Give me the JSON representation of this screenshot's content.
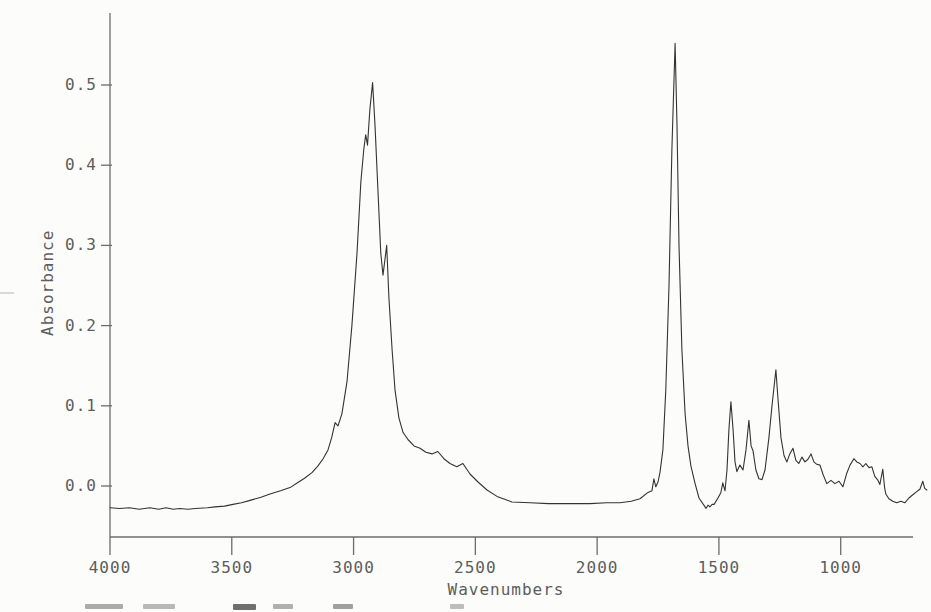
{
  "chart_data": {
    "type": "line",
    "title": "",
    "xlabel": "Wavenumbers",
    "ylabel": "Absorbance",
    "grid": false,
    "legend": false,
    "x_axis": {
      "direction": "decreasing",
      "tick_values": [
        4000,
        3500,
        3000,
        2500,
        2000,
        1500,
        1000
      ],
      "tick_labels": [
        "4000",
        "3500",
        "3000",
        "2500",
        "2000",
        "1500",
        "1000"
      ],
      "drawn_range": [
        4000,
        703
      ]
    },
    "y_axis": {
      "tick_values": [
        0.0,
        0.1,
        0.2,
        0.3,
        0.4,
        0.5
      ],
      "tick_labels": [
        "0.0",
        "0.1",
        "0.2",
        "0.3",
        "0.4",
        "0.5"
      ],
      "drawn_range": [
        -0.063,
        0.59
      ]
    },
    "series": [
      {
        "name": "IR absorbance spectrum",
        "points": [
          [
            4000,
            -0.027
          ],
          [
            3960,
            -0.028
          ],
          [
            3920,
            -0.027
          ],
          [
            3880,
            -0.029
          ],
          [
            3836,
            -0.027
          ],
          [
            3800,
            -0.029
          ],
          [
            3770,
            -0.027
          ],
          [
            3740,
            -0.029
          ],
          [
            3713,
            -0.028
          ],
          [
            3680,
            -0.029
          ],
          [
            3650,
            -0.028
          ],
          [
            3600,
            -0.027
          ],
          [
            3569,
            -0.026
          ],
          [
            3530,
            -0.025
          ],
          [
            3495,
            -0.023
          ],
          [
            3460,
            -0.021
          ],
          [
            3425,
            -0.018
          ],
          [
            3380,
            -0.014
          ],
          [
            3343,
            -0.01
          ],
          [
            3300,
            -0.006
          ],
          [
            3261,
            -0.002
          ],
          [
            3230,
            0.004
          ],
          [
            3200,
            0.01
          ],
          [
            3170,
            0.017
          ],
          [
            3146,
            0.025
          ],
          [
            3125,
            0.034
          ],
          [
            3105,
            0.045
          ],
          [
            3090,
            0.06
          ],
          [
            3076,
            0.079
          ],
          [
            3064,
            0.075
          ],
          [
            3048,
            0.09
          ],
          [
            3027,
            0.13
          ],
          [
            3007,
            0.2
          ],
          [
            2986,
            0.29
          ],
          [
            2970,
            0.38
          ],
          [
            2958,
            0.42
          ],
          [
            2950,
            0.438
          ],
          [
            2943,
            0.425
          ],
          [
            2933,
            0.47
          ],
          [
            2922,
            0.503
          ],
          [
            2912,
            0.45
          ],
          [
            2900,
            0.37
          ],
          [
            2888,
            0.29
          ],
          [
            2879,
            0.263
          ],
          [
            2864,
            0.3
          ],
          [
            2855,
            0.235
          ],
          [
            2842,
            0.17
          ],
          [
            2830,
            0.12
          ],
          [
            2814,
            0.085
          ],
          [
            2797,
            0.067
          ],
          [
            2777,
            0.058
          ],
          [
            2752,
            0.05
          ],
          [
            2727,
            0.047
          ],
          [
            2703,
            0.042
          ],
          [
            2678,
            0.04
          ],
          [
            2654,
            0.043
          ],
          [
            2629,
            0.034
          ],
          [
            2604,
            0.028
          ],
          [
            2576,
            0.024
          ],
          [
            2551,
            0.028
          ],
          [
            2522,
            0.015
          ],
          [
            2489,
            0.005
          ],
          [
            2452,
            -0.005
          ],
          [
            2411,
            -0.013
          ],
          [
            2366,
            -0.018
          ],
          [
            2350,
            -0.02
          ],
          [
            2276,
            -0.021
          ],
          [
            2200,
            -0.022
          ],
          [
            2153,
            -0.022
          ],
          [
            2090,
            -0.022
          ],
          [
            2030,
            -0.022
          ],
          [
            1960,
            -0.021
          ],
          [
            1906,
            -0.021
          ],
          [
            1860,
            -0.019
          ],
          [
            1824,
            -0.016
          ],
          [
            1791,
            -0.008
          ],
          [
            1775,
            -0.006
          ],
          [
            1767,
            0.009
          ],
          [
            1759,
            -0.001
          ],
          [
            1750,
            0.005
          ],
          [
            1742,
            0.017
          ],
          [
            1730,
            0.045
          ],
          [
            1718,
            0.12
          ],
          [
            1705,
            0.25
          ],
          [
            1693,
            0.42
          ],
          [
            1680,
            0.552
          ],
          [
            1672,
            0.45
          ],
          [
            1664,
            0.3
          ],
          [
            1652,
            0.17
          ],
          [
            1639,
            0.09
          ],
          [
            1627,
            0.05
          ],
          [
            1615,
            0.025
          ],
          [
            1598,
            0.003
          ],
          [
            1582,
            -0.015
          ],
          [
            1566,
            -0.022
          ],
          [
            1559,
            -0.025
          ],
          [
            1553,
            -0.028
          ],
          [
            1545,
            -0.024
          ],
          [
            1537,
            -0.026
          ],
          [
            1528,
            -0.023
          ],
          [
            1520,
            -0.023
          ],
          [
            1504,
            -0.015
          ],
          [
            1492,
            -0.008
          ],
          [
            1484,
            0.004
          ],
          [
            1475,
            -0.006
          ],
          [
            1467,
            0.02
          ],
          [
            1459,
            0.07
          ],
          [
            1451,
            0.105
          ],
          [
            1442,
            0.07
          ],
          [
            1434,
            0.03
          ],
          [
            1426,
            0.018
          ],
          [
            1414,
            0.026
          ],
          [
            1401,
            0.02
          ],
          [
            1389,
            0.045
          ],
          [
            1377,
            0.082
          ],
          [
            1368,
            0.05
          ],
          [
            1360,
            0.044
          ],
          [
            1348,
            0.02
          ],
          [
            1336,
            0.009
          ],
          [
            1323,
            0.008
          ],
          [
            1311,
            0.02
          ],
          [
            1295,
            0.06
          ],
          [
            1282,
            0.1
          ],
          [
            1266,
            0.145
          ],
          [
            1258,
            0.11
          ],
          [
            1245,
            0.06
          ],
          [
            1233,
            0.038
          ],
          [
            1221,
            0.03
          ],
          [
            1209,
            0.04
          ],
          [
            1196,
            0.047
          ],
          [
            1184,
            0.032
          ],
          [
            1172,
            0.028
          ],
          [
            1159,
            0.036
          ],
          [
            1147,
            0.03
          ],
          [
            1135,
            0.033
          ],
          [
            1122,
            0.04
          ],
          [
            1110,
            0.03
          ],
          [
            1098,
            0.027
          ],
          [
            1085,
            0.026
          ],
          [
            1073,
            0.015
          ],
          [
            1057,
            0.003
          ],
          [
            1040,
            0.007
          ],
          [
            1024,
            0.003
          ],
          [
            1007,
            0.006
          ],
          [
            991,
            -0.001
          ],
          [
            975,
            0.016
          ],
          [
            962,
            0.026
          ],
          [
            946,
            0.034
          ],
          [
            934,
            0.03
          ],
          [
            921,
            0.028
          ],
          [
            909,
            0.024
          ],
          [
            897,
            0.028
          ],
          [
            884,
            0.023
          ],
          [
            872,
            0.024
          ],
          [
            860,
            0.012
          ],
          [
            847,
            0.007
          ],
          [
            839,
            0.002
          ],
          [
            827,
            0.021
          ],
          [
            820,
            -0.002
          ],
          [
            815,
            -0.01
          ],
          [
            802,
            -0.016
          ],
          [
            786,
            -0.019
          ],
          [
            770,
            -0.021
          ],
          [
            753,
            -0.019
          ],
          [
            737,
            -0.021
          ],
          [
            720,
            -0.015
          ],
          [
            704,
            -0.011
          ],
          [
            688,
            -0.007
          ],
          [
            675,
            -0.004
          ],
          [
            663,
            0.006
          ],
          [
            655,
            -0.003
          ],
          [
            646,
            -0.005
          ]
        ]
      }
    ]
  }
}
